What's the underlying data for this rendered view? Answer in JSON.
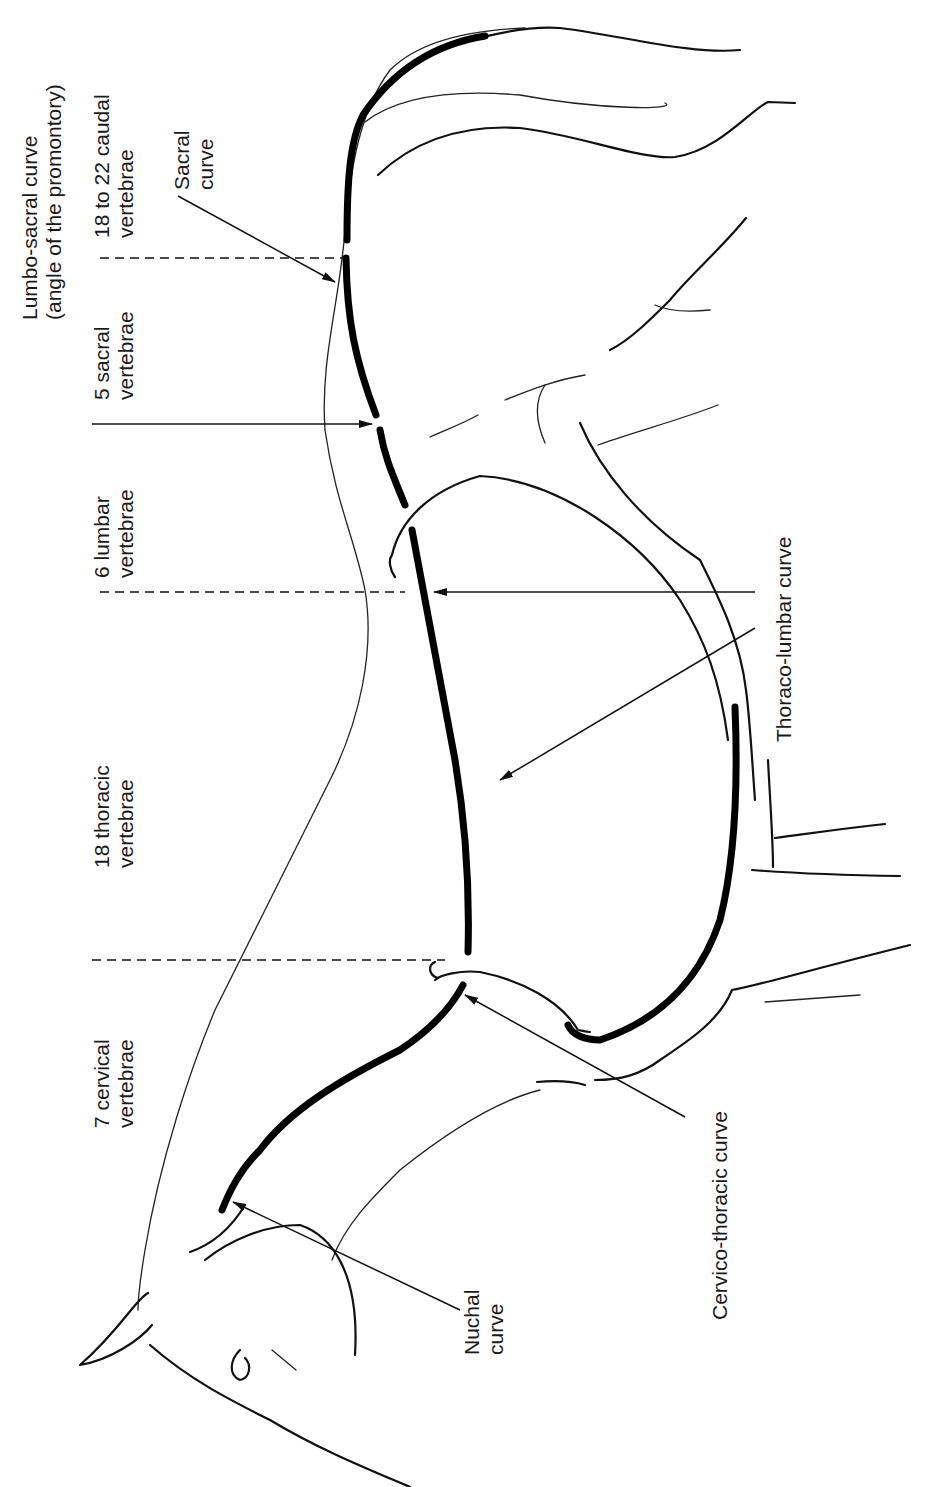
{
  "figure": {
    "orientation": "rotated 90 degrees counter-clockwise",
    "colors": {
      "line": "#000000",
      "background": "#ffffff"
    }
  },
  "segment_labels": {
    "cervical": {
      "line1": "7 cervical",
      "line2": "vertebrae"
    },
    "thoracic": {
      "line1": "18 thoracic",
      "line2": "vertebrae"
    },
    "lumbar": {
      "line1": "6 lumbar",
      "line2": "vertebrae"
    },
    "sacral": {
      "line1": "5 sacral",
      "line2": "vertebrae"
    },
    "caudal": {
      "line1": "18 to 22 caudal",
      "line2": "vertebrae"
    }
  },
  "curve_labels": {
    "lumbo_sacral": {
      "line1": "Lumbo-sacral curve",
      "line2": "(angle of the promontory)"
    },
    "sacral": {
      "line1": "Sacral",
      "line2": "curve"
    },
    "thoraco_lumbar": {
      "line1": "Thoraco-lumbar curve"
    },
    "cervico_thoracic": {
      "line1": "Cervico-thoracic curve"
    },
    "nuchal": {
      "line1": "Nuchal",
      "line2": "curve"
    }
  }
}
